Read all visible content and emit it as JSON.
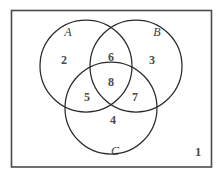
{
  "diagram": {
    "type": "venn",
    "universe": {
      "label": "",
      "outside_region_number": "1"
    },
    "sets": [
      {
        "id": "A",
        "label": "A",
        "cx": 86,
        "cy": 66,
        "r": 46
      },
      {
        "id": "B",
        "label": "B",
        "cx": 136,
        "cy": 66,
        "r": 46
      },
      {
        "id": "C",
        "label": "C",
        "cx": 111,
        "cy": 108,
        "r": 46
      }
    ],
    "regions": [
      {
        "id": "outside",
        "name": "outside-all-sets",
        "number": "1",
        "x": 198,
        "y": 156
      },
      {
        "id": "A_only",
        "name": "a-only",
        "number": "2",
        "x": 64,
        "y": 64
      },
      {
        "id": "B_only",
        "name": "b-only",
        "number": "3",
        "x": 152,
        "y": 64
      },
      {
        "id": "C_only",
        "name": "c-only",
        "number": "4",
        "x": 113,
        "y": 124
      },
      {
        "id": "A_and_C",
        "name": "a-intersect-c",
        "number": "5",
        "x": 87,
        "y": 101
      },
      {
        "id": "A_and_B",
        "name": "a-intersect-b",
        "number": "6",
        "x": 111,
        "y": 61
      },
      {
        "id": "B_and_C",
        "name": "b-intersect-c",
        "number": "7",
        "x": 135,
        "y": 101
      },
      {
        "id": "A_and_B_and_C",
        "name": "a-intersect-b-intersect-c",
        "number": "8",
        "x": 111,
        "y": 86
      }
    ],
    "set_labels": [
      {
        "id": "A",
        "text": "A",
        "x": 68,
        "y": 36
      },
      {
        "id": "B",
        "text": "B",
        "x": 157,
        "y": 36
      },
      {
        "id": "C",
        "text": "C",
        "x": 115,
        "y": 155
      }
    ],
    "colors": {
      "background": "#ffffff",
      "circle_stroke": "#2b2b2b",
      "rect_stroke": "#4a4a4a",
      "number_fill": "#4a4a4a",
      "label_fill": "#3a3a3a"
    }
  }
}
